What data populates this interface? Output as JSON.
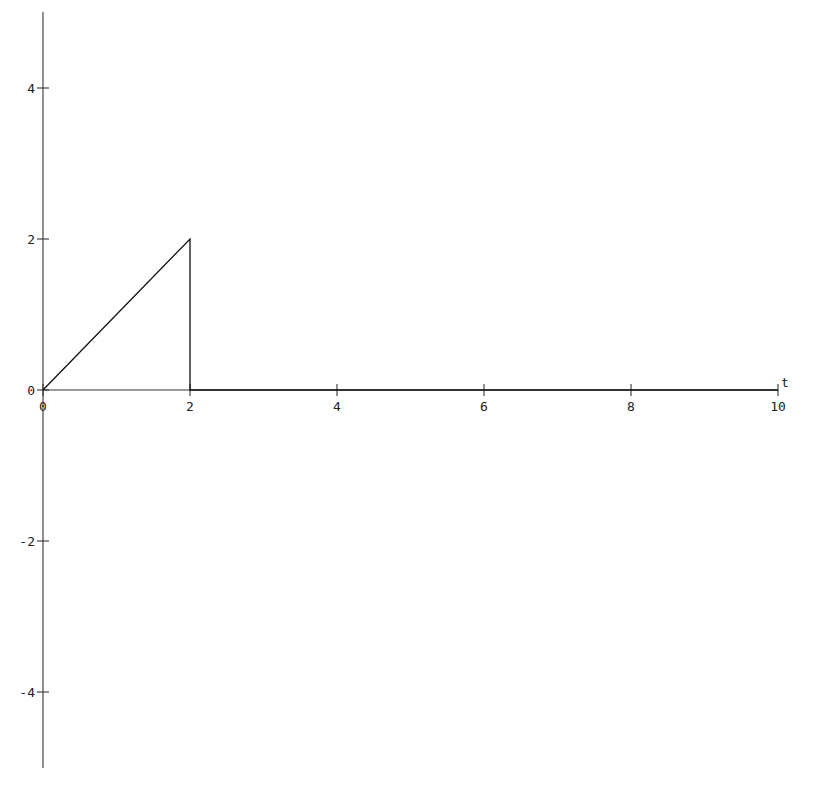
{
  "chart_data": {
    "type": "line",
    "title": "",
    "xlabel": "t",
    "ylabel": "",
    "xlim": [
      0,
      10
    ],
    "ylim": [
      -5,
      5
    ],
    "grid": false,
    "legend": null,
    "x_ticks": [
      0,
      2,
      4,
      6,
      8,
      10
    ],
    "x_tick_labels": [
      "0",
      "2",
      "4",
      "6",
      "8",
      "10"
    ],
    "y_ticks": [
      4,
      2,
      0,
      -2,
      -4
    ],
    "y_tick_labels": [
      "4",
      "2",
      "0",
      "-2",
      "-4"
    ],
    "series": [
      {
        "name": "f(t)",
        "x": [
          0,
          2,
          2,
          10
        ],
        "y": [
          0,
          2,
          0,
          0
        ],
        "color": "#111111"
      }
    ]
  },
  "colors": {
    "axis": "#333333",
    "curve": "#111111",
    "background": "#ffffff"
  }
}
